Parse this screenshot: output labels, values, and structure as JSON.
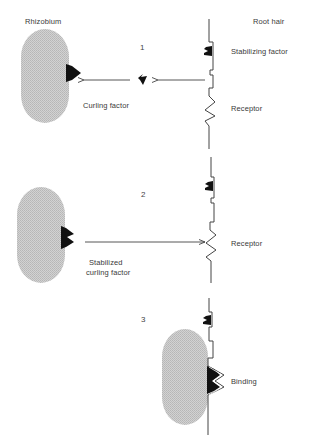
{
  "diagram": {
    "header": {
      "left_title": "Rhizobium",
      "right_title": "Root hair"
    },
    "steps": [
      {
        "number": "1",
        "labels": {
          "stabilizing_factor": "Stabilizing factor",
          "curling_factor": "Curling factor",
          "receptor": "Receptor"
        }
      },
      {
        "number": "2",
        "labels": {
          "stabilized_curling_factor_line1": "Stabilized",
          "stabilized_curling_factor_line2": "curling factor",
          "receptor": "Receptor"
        }
      },
      {
        "number": "3",
        "labels": {
          "binding": "Binding"
        }
      }
    ],
    "colors": {
      "bacterium_fill": "#c4c4c4",
      "line": "#444444",
      "factor": "#111111",
      "text": "#3a3a3a"
    }
  }
}
